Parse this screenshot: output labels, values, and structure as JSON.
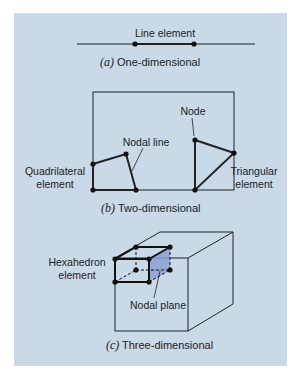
{
  "figure": {
    "background_color": "#c9d9e7",
    "line_color": "#222222",
    "plane_color": "#8c9fd4",
    "panel_a": {
      "label": "Line element",
      "caption_letter": "(a)",
      "caption_text": "One-dimensional"
    },
    "panel_b": {
      "label_node": "Node",
      "label_nodal_line": "Nodal line",
      "label_quad_1": "Quadrilateral",
      "label_quad_2": "element",
      "label_tri_1": "Triangular",
      "label_tri_2": "element",
      "caption_letter": "(b)",
      "caption_text": "Two-dimensional"
    },
    "panel_c": {
      "label_hex_1": "Hexahedron",
      "label_hex_2": "element",
      "label_nodal_plane": "Nodal plane",
      "caption_letter": "(c)",
      "caption_text": "Three-dimensional"
    }
  }
}
